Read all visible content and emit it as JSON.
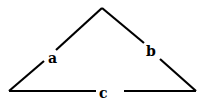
{
  "diagram": {
    "type": "triangle",
    "stroke_color": "#000000",
    "background": "#ffffff",
    "vertices": {
      "left": [
        9,
        91
      ],
      "apex": [
        102,
        8
      ],
      "right": [
        196,
        91
      ]
    },
    "sides": [
      {
        "name": "a",
        "label": "a",
        "from": "left",
        "to": "apex"
      },
      {
        "name": "b",
        "label": "b",
        "from": "apex",
        "to": "right"
      },
      {
        "name": "c",
        "label": "c",
        "from": "left",
        "to": "right"
      }
    ]
  }
}
